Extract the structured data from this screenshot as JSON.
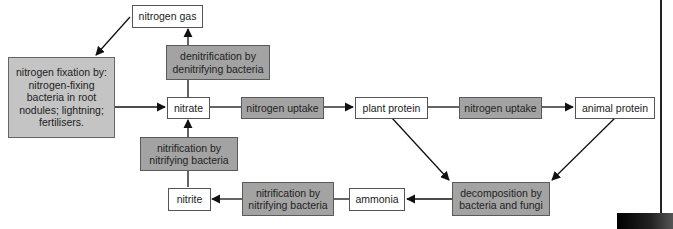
{
  "diagram": {
    "nodes": {
      "nitrogen_gas": "nitrogen gas",
      "denitrification": "denitrification by denitrifying bacteria",
      "nitrogen_fixation": "nitrogen fixation by: nitrogen-fixing bacteria in root nodules; lightning; fertilisers.",
      "nitrate": "nitrate",
      "nitrogen_uptake_1": "nitrogen uptake",
      "plant_protein": "plant protein",
      "nitrogen_uptake_2": "nitrogen uptake",
      "animal_protein": "animal protein",
      "nitrification_upper": "nitrification by nitrifying bacteria",
      "nitrite": "nitrite",
      "nitrification_lower": "nitrification by nitrifying bacteria",
      "ammonia": "ammonia",
      "decomposition": "decomposition by bacteria and fungi"
    },
    "edges": [
      {
        "from": "nitrate",
        "to": "nitrogen_gas",
        "via": "denitrification"
      },
      {
        "from": "nitrogen_gas",
        "to": "nitrogen_fixation"
      },
      {
        "from": "nitrogen_fixation",
        "to": "nitrate"
      },
      {
        "from": "nitrate",
        "to": "plant_protein",
        "via": "nitrogen_uptake_1"
      },
      {
        "from": "plant_protein",
        "to": "animal_protein",
        "via": "nitrogen_uptake_2"
      },
      {
        "from": "plant_protein",
        "to": "decomposition"
      },
      {
        "from": "animal_protein",
        "to": "decomposition"
      },
      {
        "from": "decomposition",
        "to": "ammonia"
      },
      {
        "from": "ammonia",
        "to": "nitrite",
        "via": "nitrification_lower"
      },
      {
        "from": "nitrite",
        "to": "nitrate",
        "via": "nitrification_upper"
      }
    ],
    "colors": {
      "process_box": "#a3a3a3",
      "fixation_box": "#c4c4c4",
      "substance_box": "#ffffff",
      "line": "#111111"
    }
  }
}
